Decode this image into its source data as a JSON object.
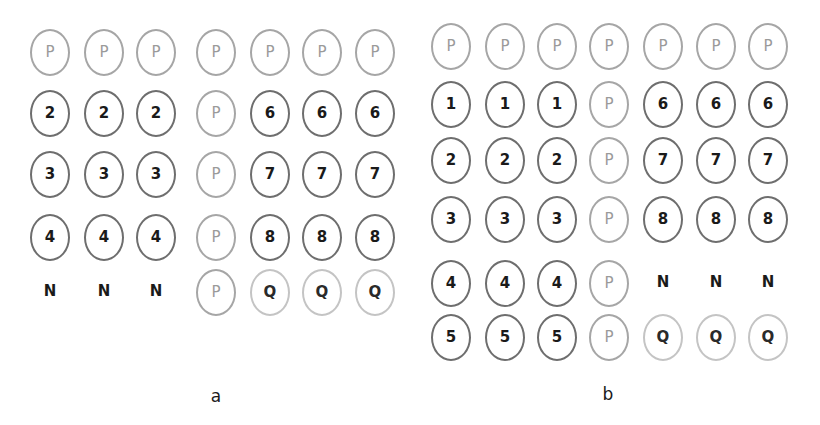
{
  "panels": [
    {
      "caption": "a",
      "caption_pos": [
        216,
        398
      ],
      "col_x": [
        50,
        104,
        156,
        216,
        270,
        322,
        375
      ],
      "row_y": [
        52,
        113,
        174,
        237,
        292
      ],
      "rows": [
        [
          "P",
          "P",
          "P",
          "P",
          "P",
          "P",
          "P"
        ],
        [
          "2",
          "2",
          "2",
          "P",
          "6",
          "6",
          "6"
        ],
        [
          "3",
          "3",
          "3",
          "P",
          "7",
          "7",
          "7"
        ],
        [
          "4",
          "4",
          "4",
          "P",
          "8",
          "8",
          "8"
        ],
        [
          "N",
          "N",
          "N",
          "P",
          "Q",
          "Q",
          "Q"
        ]
      ]
    },
    {
      "caption": "b",
      "caption_pos": [
        608,
        396
      ],
      "col_x": [
        451,
        505,
        557,
        609,
        663,
        716,
        768
      ],
      "row_y": [
        46,
        104,
        160,
        219,
        283,
        337
      ],
      "rows": [
        [
          "P",
          "P",
          "P",
          "P",
          "P",
          "P",
          "P"
        ],
        [
          "1",
          "1",
          "1",
          "P",
          "6",
          "6",
          "6"
        ],
        [
          "2",
          "2",
          "2",
          "P",
          "7",
          "7",
          "7"
        ],
        [
          "3",
          "3",
          "3",
          "P",
          "8",
          "8",
          "8"
        ],
        [
          "4",
          "4",
          "4",
          "P",
          "N",
          "N",
          "N"
        ],
        [
          "5",
          "5",
          "5",
          "P",
          "Q",
          "Q",
          "Q"
        ]
      ]
    }
  ],
  "legend_styles": {
    "P": "light-circle",
    "Q": "faint-circle",
    "N": "no-circle",
    "number": "dark-circle"
  }
}
